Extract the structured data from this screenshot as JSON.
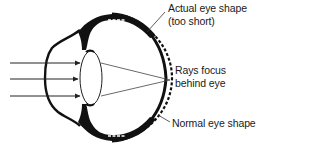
{
  "diagram": {
    "labels": {
      "actual_shape_line1": "Actual eye shape",
      "actual_shape_line2": "(too short)",
      "rays_line1": "Rays focus",
      "rays_line2": "behind eye",
      "normal_shape": "Normal eye shape"
    },
    "elements": [
      {
        "id": "incoming-rays",
        "count": 3,
        "type": "arrow"
      },
      {
        "id": "cornea",
        "type": "curve"
      },
      {
        "id": "lens",
        "type": "ellipse"
      },
      {
        "id": "actual-eye-outline",
        "type": "solid-thick"
      },
      {
        "id": "normal-eye-outline",
        "type": "dashed"
      },
      {
        "id": "refracted-rays",
        "converge": "behind retina"
      }
    ],
    "colors": {
      "ink": "#111111",
      "background": "#ffffff",
      "ray": "#444444"
    }
  }
}
